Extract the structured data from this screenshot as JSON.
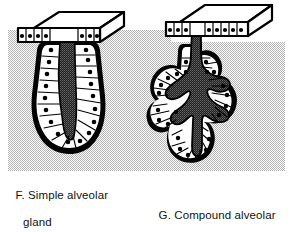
{
  "figure": {
    "kind": "histology-diagram",
    "title_present": false,
    "background_color": "#ffffff",
    "tint_color": "#d9d9d9",
    "ink_color": "#000000",
    "lumen_color": "#3c3c3c",
    "cell_fill_color": "#ffffff",
    "nucleus_color": "#000000",
    "tint_regions": [
      {
        "name": "left-tint-panel",
        "x": 8,
        "y": 30,
        "width": 163,
        "height": 141
      },
      {
        "name": "right-tint-panel",
        "x": 171,
        "y": 42,
        "width": 114,
        "height": 129
      }
    ]
  },
  "panels": [
    {
      "id": "F",
      "letter": "F.",
      "name": "simple-alveolar-gland",
      "label_line1": "F. Simple alveolar",
      "label_line2": "gland",
      "full_label": "F. Simple alveolar gland",
      "structures": [
        "epithelial-surface-slab",
        "duct-neck",
        "secretory-alveolus",
        "lumen",
        "columnar-cells",
        "nuclei"
      ],
      "surface_cell_count": 9,
      "alveolus_cell_count": 26
    },
    {
      "id": "G",
      "letter": "G.",
      "name": "compound-alveolar-gland",
      "label_line1": "G. Compound alveolar",
      "label_line2": "gland",
      "full_label": "G. Compound alveolar gland",
      "structures": [
        "epithelial-surface-slab",
        "duct-neck",
        "branched-duct",
        "secretory-acini",
        "lumen",
        "columnar-cells",
        "nuclei"
      ],
      "surface_cell_count": 11,
      "acini_count": 5
    }
  ]
}
